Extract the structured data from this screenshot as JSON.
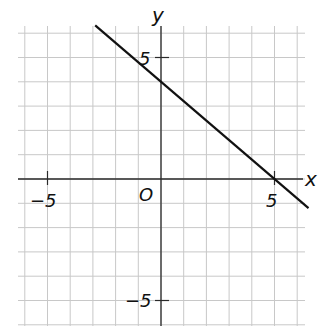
{
  "chart_data": {
    "type": "line",
    "title": "",
    "xlabel": "x",
    "ylabel": "y",
    "origin_label": "O",
    "xlim": [
      -6.3,
      6.3
    ],
    "ylim": [
      -6.2,
      6.2
    ],
    "grid": true,
    "grid_step": 1,
    "x_ticks": [
      {
        "value": -5,
        "label": "-5"
      },
      {
        "value": 5,
        "label": "5"
      }
    ],
    "y_ticks": [
      {
        "value": 5,
        "label": "5"
      },
      {
        "value": -5,
        "label": "-5"
      }
    ],
    "series": [
      {
        "name": "line",
        "equation": "y = -0.8x + 4",
        "slope": -0.8,
        "intercept": 4,
        "x": [
          -2.9,
          0,
          5,
          6.5
        ],
        "y": [
          6.32,
          4,
          0,
          -1.2
        ]
      }
    ],
    "intercepts": {
      "x_intercept": 5,
      "y_intercept": 4
    },
    "colors": {
      "line": "#111111",
      "grid": "#c8c8c8",
      "axis": "#2a2a2a"
    }
  },
  "labels": {
    "x_axis": "x",
    "y_axis": "y",
    "origin": "O",
    "x_tick_neg5": "−5",
    "x_tick_5": "5",
    "y_tick_5": "5",
    "y_tick_neg5": "−5"
  }
}
